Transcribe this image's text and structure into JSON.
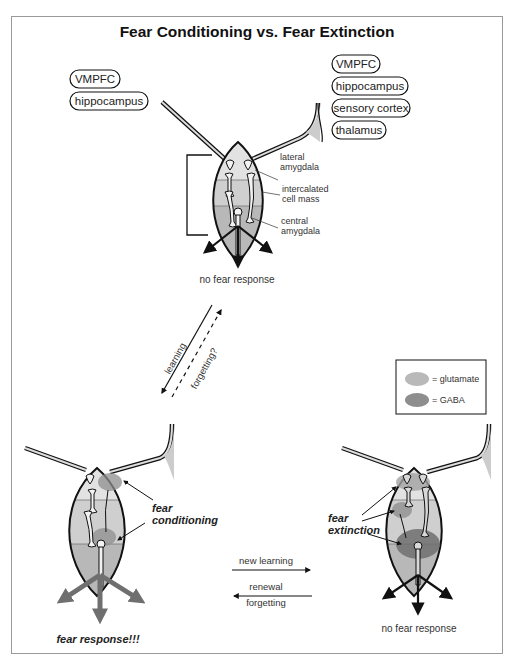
{
  "title": "Fear Conditioning vs. Fear Extinction",
  "top_panel": {
    "left_inputs": [
      "VMPFC",
      "hippocampus"
    ],
    "right_inputs": [
      "VMPFC",
      "hippocampus",
      "sensory cortex",
      "thalamus"
    ],
    "region_labels": {
      "lateral": [
        "lateral",
        "amygdala"
      ],
      "itc": [
        "intercalated",
        "cell mass"
      ],
      "central": [
        "central",
        "amygdala"
      ]
    },
    "outcome": "no fear response"
  },
  "diagonal_arrows": {
    "solid": "learning",
    "dashed": "forgetting?"
  },
  "legend": {
    "items": [
      {
        "label": "= glutamate",
        "color": "#b9b9b9"
      },
      {
        "label": "= GABA",
        "color": "#8e8e8e"
      }
    ]
  },
  "bottom_left": {
    "annotation": [
      "fear",
      "conditioning"
    ],
    "outcome": "fear response!!!"
  },
  "middle_arrows": {
    "right_label": "new learning",
    "left_label_1": "renewal",
    "left_label_2": "forgetting"
  },
  "bottom_right": {
    "annotation": [
      "fear",
      "extinction"
    ],
    "outcome": "no fear response"
  },
  "colors": {
    "lateral_fill": "#e2e2e2",
    "itc_fill": "#cfcfcf",
    "central_fill": "#b8b8b8",
    "outline": "#111111",
    "fear_arrow": "#6f6f6f"
  }
}
